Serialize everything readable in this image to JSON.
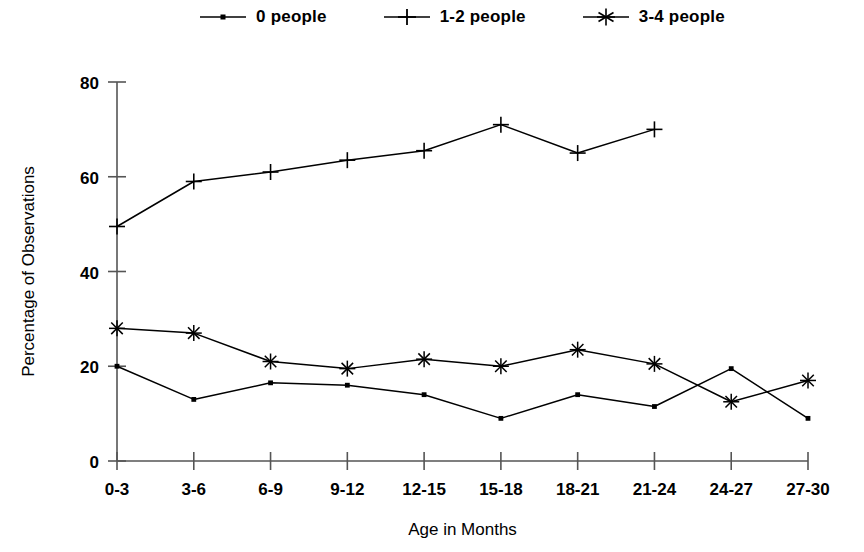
{
  "chart_data": {
    "type": "line",
    "title": "",
    "xlabel": "Age in Months",
    "ylabel": "Percentage of Observations",
    "categories": [
      "0-3",
      "3-6",
      "6-9",
      "9-12",
      "12-15",
      "15-18",
      "18-21",
      "21-24",
      "24-27",
      "27-30"
    ],
    "ylim": [
      0,
      80
    ],
    "yticks": [
      0,
      20,
      40,
      60,
      80
    ],
    "grid": false,
    "legend_position": "top",
    "series": [
      {
        "name": "0 people",
        "marker": "dot",
        "values": [
          20,
          13,
          16.5,
          16,
          14,
          9,
          14,
          11.5,
          19.5,
          9
        ]
      },
      {
        "name": "1-2 people",
        "marker": "plus",
        "values": [
          49.5,
          59,
          61,
          63.5,
          65.5,
          71,
          65,
          70,
          null,
          null
        ]
      },
      {
        "name": "3-4 people",
        "marker": "asterisk",
        "values": [
          28,
          27,
          21,
          19.5,
          21.5,
          20,
          23.5,
          20.5,
          12.5,
          17
        ]
      }
    ]
  },
  "legend": {
    "items": [
      {
        "label": "0 people",
        "marker": "dot-marker-icon"
      },
      {
        "label": "1-2 people",
        "marker": "plus-marker-icon"
      },
      {
        "label": "3-4 people",
        "marker": "asterisk-marker-icon"
      }
    ]
  },
  "axes": {
    "y_tick_labels": [
      "80",
      "60",
      "40",
      "20",
      "0"
    ],
    "x_tick_labels": [
      "0-3",
      "3-6",
      "6-9",
      "9-12",
      "12-15",
      "15-18",
      "18-21",
      "21-24",
      "24-27",
      "27-30"
    ],
    "y_axis_title": "Percentage of Observations",
    "x_axis_title": "Age in Months"
  },
  "colors": {
    "line": "#000000",
    "axis": "#555555",
    "background": "#ffffff"
  }
}
